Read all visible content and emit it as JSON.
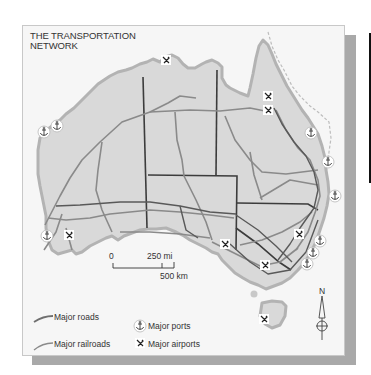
{
  "map": {
    "title_line1": "THE TRANSPORTATION",
    "title_line2": "NETWORK",
    "colors": {
      "land": "#d9d9d9",
      "coast_outline": "#b3b3b3",
      "roads": "#7f7f7f",
      "railroads": "#4a4a4a",
      "borders": "#3c3c3c",
      "panel": "#f6f6f6",
      "shadow": "#a9a9a9"
    },
    "scale_bar": {
      "zero": "0",
      "miles": "250 mi",
      "km": "500 km"
    },
    "north_label": "N",
    "legend": {
      "roads": "Major roads",
      "railroads": "Major railroads",
      "ports": "Major ports",
      "airports": "Major airports"
    },
    "icons": {
      "port": "anchor-icon",
      "airport": "airplane-icon",
      "north_arrow": "north-arrow-icon"
    },
    "ports_count": 8,
    "airports_count": 8
  }
}
